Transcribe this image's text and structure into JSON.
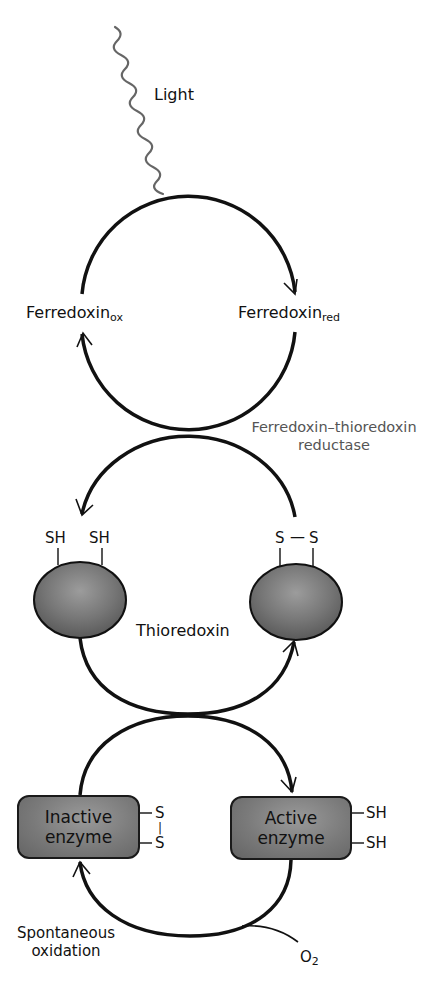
{
  "diagram": {
    "title": "",
    "labels": {
      "light": "Light",
      "ferredoxin_ox": {
        "base": "Ferredoxin",
        "sub": "ox"
      },
      "ferredoxin_red": {
        "base": "Ferredoxin",
        "sub": "red"
      },
      "enzyme_ftr": {
        "line1": "Ferredoxin–thioredoxin",
        "line2": "reductase"
      },
      "thioredoxin": "Thioredoxin",
      "spontaneous_oxidation": {
        "line1": "Spontaneous",
        "line2": "oxidation"
      },
      "oxygen": {
        "base": "O",
        "sub": "2"
      }
    },
    "thioredoxin_reduced": {
      "groups": [
        "SH",
        "SH"
      ]
    },
    "thioredoxin_oxidized": {
      "groups": [
        "S",
        "S"
      ],
      "bond": "—"
    },
    "inactive_enzyme": {
      "line1": "Inactive",
      "line2": "enzyme",
      "groups": [
        "S",
        "S"
      ],
      "bond": "|"
    },
    "active_enzyme": {
      "line1": "Active",
      "line2": "enzyme",
      "groups": [
        "SH",
        "SH"
      ]
    },
    "colors": {
      "arrow": "#111111",
      "light_wave": "#666666",
      "secondary_label": "#555555",
      "protein_fill": "#7a7a7a"
    }
  }
}
